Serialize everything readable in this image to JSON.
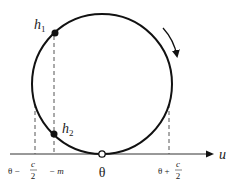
{
  "diagram": {
    "colors": {
      "stroke": "#111111",
      "dashed": "#555555",
      "text": "#222222",
      "background": "#ffffff"
    },
    "axis": {
      "label": "u"
    },
    "points": {
      "h1": {
        "label": "h",
        "subscript": "1"
      },
      "h2": {
        "label": "h",
        "subscript": "2"
      },
      "theta": {
        "label": "θ"
      }
    },
    "tick_labels": {
      "left_main": "θ −",
      "left_frac_num": "c",
      "left_frac_den": "2",
      "m_label": "− m",
      "center": "θ",
      "right_main": "θ +",
      "right_frac_num": "c",
      "right_frac_den": "2"
    },
    "direction_arrow": "clockwise"
  }
}
